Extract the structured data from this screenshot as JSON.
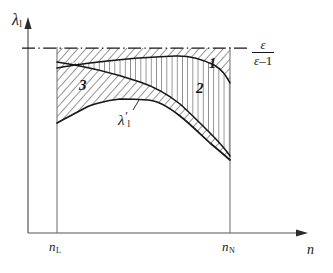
{
  "figure": {
    "kind": "line-diagram",
    "background_color": "#ffffff",
    "ink_color": "#161616"
  },
  "axes": {
    "y_label": "λ",
    "y_label_sub": "l",
    "x_label": "n",
    "x_axis_arrow": true,
    "y_axis_arrow": true,
    "origin_px": {
      "x": 28,
      "y": 233
    },
    "x_ticks": [
      {
        "name": "n-lower",
        "label": "n",
        "sub": "L",
        "x_px": 57
      },
      {
        "name": "n-upper",
        "label": "n",
        "sub": "N",
        "x_px": 230
      }
    ]
  },
  "asymptote": {
    "name": "epsilon-over-epsilon-minus-one",
    "style": "dash-dot",
    "y_px": 48,
    "numerator": "ε",
    "denominator_sym": "ε",
    "denominator_op": "–",
    "denominator_num": "1"
  },
  "curves": [
    {
      "name": "upper-boundary-curve",
      "description": "boundary between region 1 and region 2, rises from left toward the asymptote",
      "points_px": [
        [
          57,
          68
        ],
        [
          90,
          63
        ],
        [
          130,
          59
        ],
        [
          175,
          56
        ],
        [
          205,
          62
        ],
        [
          222,
          72
        ],
        [
          230,
          83
        ]
      ]
    },
    {
      "name": "middle-boundary-curve",
      "description": "boundary between region 3 and region 2",
      "points_px": [
        [
          57,
          62
        ],
        [
          95,
          70
        ],
        [
          140,
          82
        ],
        [
          180,
          104
        ],
        [
          210,
          133
        ],
        [
          230,
          156
        ]
      ]
    },
    {
      "name": "lambda-prime-curve",
      "description": "lambda prime curve bounding region 3 from below",
      "label": "λ",
      "label_sub": "l",
      "label_prime": "′",
      "points_px": [
        [
          57,
          123
        ],
        [
          85,
          108
        ],
        [
          120,
          99
        ],
        [
          148,
          100
        ],
        [
          180,
          116
        ],
        [
          210,
          143
        ],
        [
          230,
          160
        ]
      ]
    }
  ],
  "regions": [
    {
      "name": "region-1",
      "label": "1",
      "hatch": "diagonal",
      "description": "band between the epsilon/(epsilon-1) asymptote and the upper boundary curve"
    },
    {
      "name": "region-2",
      "label": "2",
      "hatch": "vertical",
      "description": "band between the upper boundary curve and the middle boundary curve"
    },
    {
      "name": "region-3",
      "label": "3",
      "hatch": "diagonal",
      "description": "band between the middle boundary curve and the lambda-prime curve"
    }
  ]
}
